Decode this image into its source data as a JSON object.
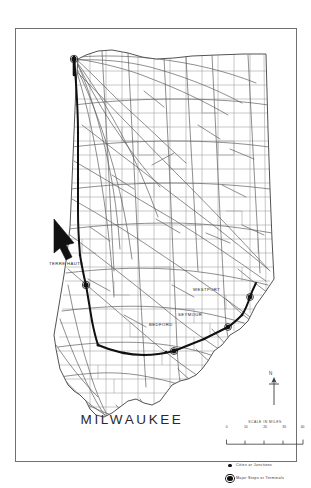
{
  "document": {
    "kind": "railroad-route-map",
    "state_depicted": "Indiana",
    "route_title": "MILWAUKEE"
  },
  "map": {
    "city_labels": [
      {
        "name": "TERRE HAUTE",
        "text": "TERRE HAUTE",
        "x": 48,
        "y": 261
      },
      {
        "name": "WESTPORT",
        "text": "WESTPORT",
        "x": 192,
        "y": 287
      },
      {
        "name": "SEYMOUR",
        "text": "SEYMOUR",
        "x": 177,
        "y": 312
      },
      {
        "name": "BEDFORD",
        "text": "BEDFORD",
        "x": 148,
        "y": 322
      }
    ],
    "north_arrow": {
      "label": "N"
    }
  },
  "scale": {
    "caption": "SCALE IN MILES",
    "ticks": [
      "0",
      "10",
      "20",
      "30",
      "40"
    ]
  },
  "legend": {
    "items": [
      {
        "symbol": "small-filled-dot",
        "label": "Cities or Junctions"
      },
      {
        "symbol": "large-ringed-dot",
        "label": "Major Stops or Terminals"
      }
    ]
  },
  "colors": {
    "paper": "#ffffff",
    "frame": "#707070",
    "county_line": "#8d8d8d",
    "state_outline": "#3a3a3a",
    "rail_line": "#5a5a5a",
    "highlighted_route": "#111111",
    "text": "#2a2a2a"
  }
}
